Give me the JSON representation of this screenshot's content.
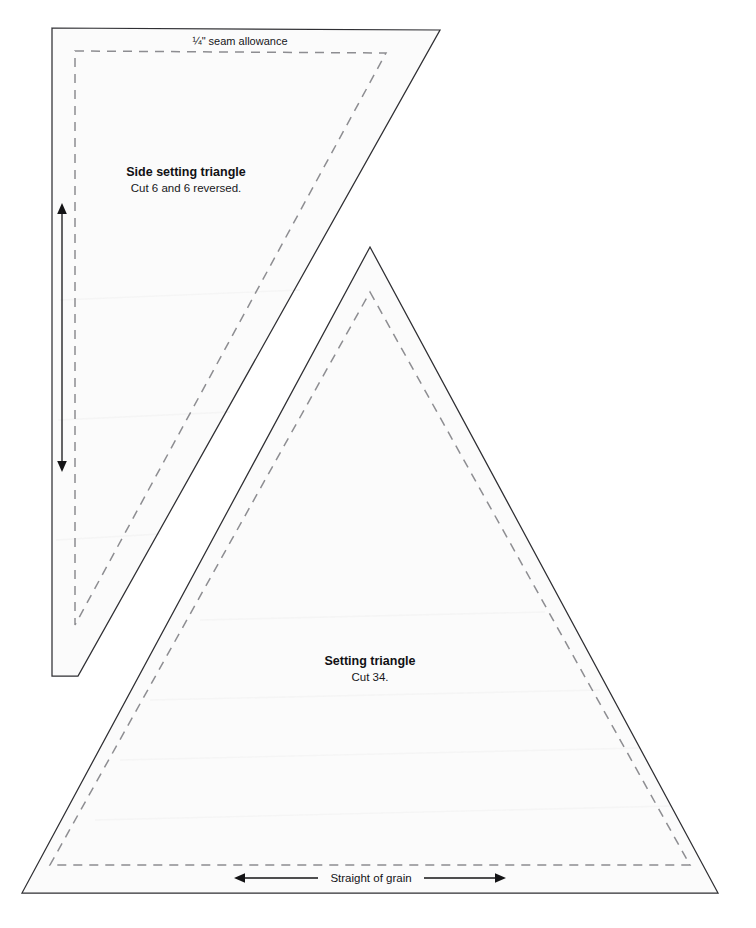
{
  "document": {
    "type": "quilting-pattern-template-sheet",
    "background_color": "#ffffff",
    "piece_fill_color": "#fbfbfb",
    "cut_line_color": "#2f2f33",
    "seam_line_color": "#8d8d91",
    "arrow_color": "#141416"
  },
  "annotations": {
    "seam_allowance_note": "¼\" seam allowance",
    "straight_of_grain": "Straight of grain"
  },
  "pieces": [
    {
      "id": "side-setting-triangle",
      "title": "Side setting triangle",
      "cut_instruction": "Cut 6 and 6 reversed.",
      "grain_direction": "vertical",
      "shape": "right-triangle",
      "cut_outline_points": "52,28 440,30 78,676 52,676",
      "seam_outline_points": "75,51 386,53 75,625",
      "label_x": 186,
      "title_y": 176,
      "sub_y": 192
    },
    {
      "id": "setting-triangle",
      "title": "Setting triangle",
      "cut_instruction": "Cut 34.",
      "grain_direction": "horizontal",
      "shape": "isosceles-triangle",
      "cut_outline_points": "370,247 718,893 22,893",
      "seam_outline_points": "370,292 690,865 50,865",
      "label_x": 370,
      "title_y": 665,
      "sub_y": 681
    }
  ],
  "grain_arrows": [
    {
      "id": "vertical-grain-arrow",
      "orientation": "vertical",
      "x": 62,
      "y_start": 205,
      "y_end": 470
    },
    {
      "id": "horizontal-grain-arrow",
      "orientation": "horizontal",
      "y": 878,
      "x_start": 235,
      "x_end": 505,
      "label": "Straight of grain"
    }
  ],
  "seam_note_position": {
    "x": 240,
    "y": 45
  }
}
